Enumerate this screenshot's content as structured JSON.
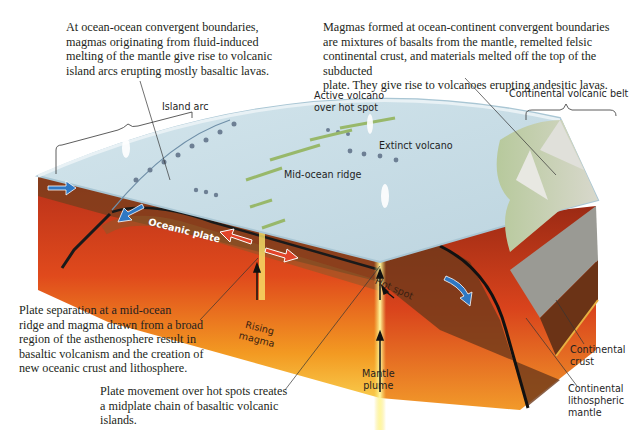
{
  "figure": {
    "type": "block-diagram"
  },
  "captions": {
    "ocean_ocean": "At ocean-ocean convergent boundaries,\nmagmas originating from fluid-induced\nmelting of the mantle give rise to volcanic\nisland arcs erupting mostly basaltic lavas.",
    "ocean_continent": "Magmas formed at ocean-continent convergent boundaries\nare mixtures of basalts from the mantle, remelted felsic\ncontinental crust, and materials melted off the top of the subducted\nplate. They give rise to volcanoes erupting andesitic lavas.",
    "mid_ocean": "Plate separation at a mid-ocean\nridge and magma drawn from a broad\nregion of the asthenosphere result in\nbasaltic volcanism and the creation of\nnew oceanic crust and lithosphere.",
    "hot_spot": "Plate movement over hot spots creates\na midplate chain of basaltic volcanic\nislands."
  },
  "labels": {
    "island_arc": "Island arc",
    "active_volcano": "Active volcano\nover hot spot",
    "extinct_volcano": "Extinct volcano",
    "mid_ocean_ridge": "Mid-ocean ridge",
    "continental_volcanic_belt": "Continental volcanic belt",
    "oceanic_plate": "Oceanic plate",
    "rising_magma": "Rising\nmagma",
    "hot_spot": "Hot spot",
    "mantle_plume": "Mantle\nplume",
    "continental_crust": "Continental\ncrust",
    "continental_lithospheric_mantle": "Continental\nlithospheric\nmantle"
  },
  "colors": {
    "ocean": "#c9dde6",
    "ocean_edge": "#a9c6d4",
    "mantle_red": "#d9431c",
    "mantle_orange": "#f08a1e",
    "mantle_yellow": "#f7c542",
    "lithosphere_brown": "#8a4a22",
    "arrow_blue": "#2f78c4",
    "arrow_red": "#e2452a",
    "crust_gray": "#9a9a94",
    "text": "#231f20"
  }
}
